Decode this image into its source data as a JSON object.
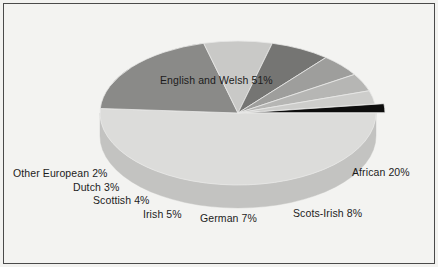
{
  "figure": {
    "background_color": "#f3f3f1",
    "border_color": "#4a4a4a",
    "width": 438,
    "height": 267
  },
  "chart_data": {
    "type": "pie",
    "title": "",
    "subtitle": "",
    "xlabel": "",
    "ylabel": "",
    "three_d": true,
    "legend_position": "none",
    "labels_position": "outside-and-inside",
    "grid": false,
    "start_angle_deg": 0,
    "direction": "clockwise",
    "categories": [
      "English and Welsh",
      "African",
      "Scots-Irish",
      "German",
      "Irish",
      "Scottish",
      "Dutch",
      "Other European"
    ],
    "values": [
      51,
      20,
      8,
      7,
      5,
      4,
      3,
      2
    ],
    "units": "percent",
    "total": 100,
    "slices": [
      {
        "label": "English and Welsh 51%",
        "name": "English and Welsh",
        "value": 51,
        "value_text": "51%",
        "color": "#dcdcda",
        "side_color": "#c3c3c1",
        "exploded": false
      },
      {
        "label": "African 20%",
        "name": "African",
        "value": 20,
        "value_text": "20%",
        "color": "#8a8a88",
        "side_color": "#6f6f6d",
        "exploded": false
      },
      {
        "label": "Scots-Irish 8%",
        "name": "Scots-Irish",
        "value": 8,
        "value_text": "8%",
        "color": "#c9c9c7",
        "side_color": "#aeaeac",
        "exploded": false
      },
      {
        "label": "German 7%",
        "name": "German",
        "value": 7,
        "value_text": "7%",
        "color": "#757573",
        "side_color": "#5e5e5c",
        "exploded": false
      },
      {
        "label": "Irish 5%",
        "name": "Irish",
        "value": 5,
        "value_text": "5%",
        "color": "#9e9e9c",
        "side_color": "#848482",
        "exploded": false
      },
      {
        "label": "Scottish 4%",
        "name": "Scottish",
        "value": 4,
        "value_text": "4%",
        "color": "#b6b6b4",
        "side_color": "#9a9a98",
        "exploded": false
      },
      {
        "label": "Dutch 3%",
        "name": "Dutch",
        "value": 3,
        "value_text": "3%",
        "color": "#cdcdcb",
        "side_color": "#b1b1af",
        "exploded": false
      },
      {
        "label": "Other European 2%",
        "name": "Other European",
        "value": 2,
        "value_text": "2%",
        "color": "#0d0d0d",
        "side_color": "#050505",
        "exploded": true
      }
    ]
  }
}
